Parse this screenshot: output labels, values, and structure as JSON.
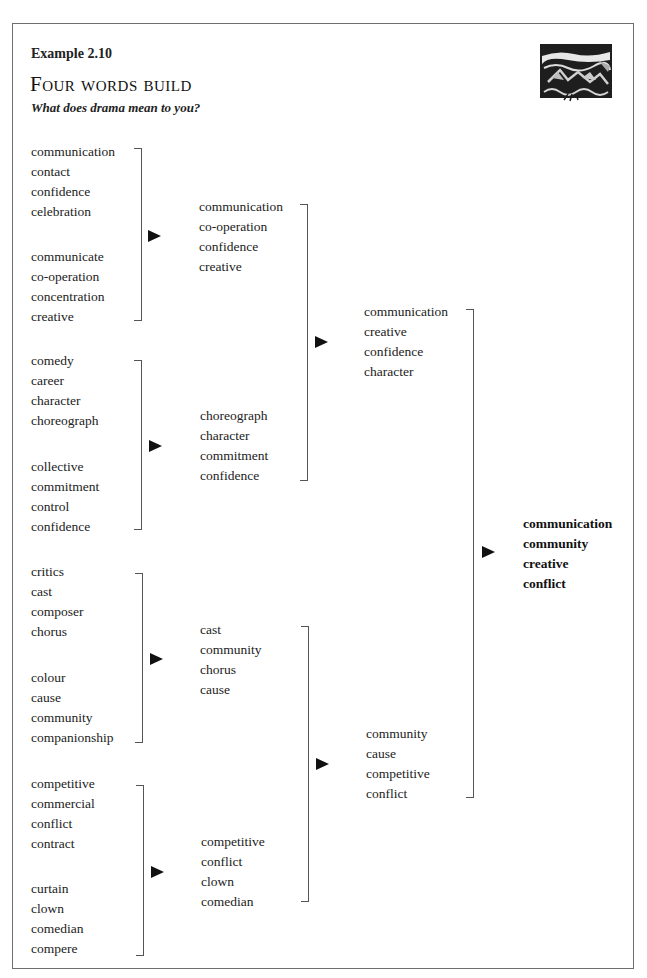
{
  "header": {
    "example_label": "Example 2.10",
    "title": "Four words build",
    "subtitle": "What does drama mean to you?",
    "illustration": "woodcut-landscape-illustration"
  },
  "round1": [
    {
      "words": [
        "communication",
        "contact",
        "confidence",
        "celebration"
      ]
    },
    {
      "words": [
        "communicate",
        "co-operation",
        "concentration",
        "creative"
      ]
    },
    {
      "words": [
        "comedy",
        "career",
        "character",
        "choreograph"
      ]
    },
    {
      "words": [
        "collective",
        "commitment",
        "control",
        "confidence"
      ]
    },
    {
      "words": [
        "critics",
        "cast",
        "composer",
        "chorus"
      ]
    },
    {
      "words": [
        "colour",
        "cause",
        "community",
        "companionship"
      ]
    },
    {
      "words": [
        "competitive",
        "commercial",
        "conflict",
        "contract"
      ]
    },
    {
      "words": [
        "curtain",
        "clown",
        "comedian",
        "compere"
      ]
    }
  ],
  "round2": [
    {
      "words": [
        "communication",
        "co-operation",
        "confidence",
        "creative"
      ]
    },
    {
      "words": [
        "choreograph",
        "character",
        "commitment",
        "confidence"
      ]
    },
    {
      "words": [
        "cast",
        "community",
        "chorus",
        "cause"
      ]
    },
    {
      "words": [
        "competitive",
        "conflict",
        "clown",
        "comedian"
      ]
    }
  ],
  "round3": [
    {
      "words": [
        "communication",
        "creative",
        "confidence",
        "character"
      ]
    },
    {
      "words": [
        "community",
        "cause",
        "competitive",
        "conflict"
      ]
    }
  ],
  "final": {
    "words": [
      "communication",
      "community",
      "creative",
      "conflict"
    ]
  }
}
